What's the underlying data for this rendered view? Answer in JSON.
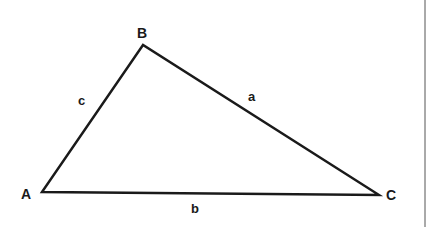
{
  "diagram": {
    "type": "triangle",
    "vertices": [
      {
        "name": "A",
        "x": 42,
        "y": 192
      },
      {
        "name": "B",
        "x": 143,
        "y": 45
      },
      {
        "name": "C",
        "x": 379,
        "y": 195
      }
    ],
    "vertex_labels": {
      "A": "A",
      "B": "B",
      "C": "C"
    },
    "side_labels": {
      "a": "a",
      "b": "b",
      "c": "c"
    },
    "stroke_color": "#1a1a1a",
    "background_color": "#ffffff"
  }
}
